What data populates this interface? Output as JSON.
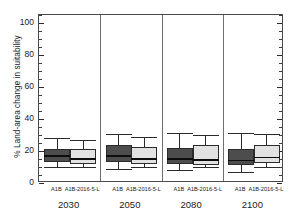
{
  "chart_data": {
    "type": "box",
    "title": "",
    "xlabel": "",
    "ylabel": "% Land-area change in suitability",
    "ylim": [
      0,
      105
    ],
    "yticks": [
      0,
      20,
      40,
      60,
      80,
      100
    ],
    "ytick_labels": [
      "0",
      "20",
      "40",
      "60",
      "80",
      "100"
    ],
    "yminor_step": 5,
    "grid": false,
    "legend": "none",
    "groups": [
      "2030",
      "2050",
      "2080",
      "2100"
    ],
    "categories": [
      "A1B",
      "A1B-2016-5-L"
    ],
    "colors": {
      "A1B": "#4d4d4d",
      "A1B-2016-5-L": "#e2e2e2",
      "outline": "#2b2b2b",
      "median": "#0d0d0d",
      "frame": "#4a4a4a",
      "separator": "#6e6e6e",
      "background": "#ffffff"
    },
    "boxes": [
      {
        "group": "2030",
        "category": "A1B",
        "whisker_low": 10.0,
        "q1": 13.0,
        "median": 17.0,
        "q3": 21.0,
        "whisker_high": 28.0
      },
      {
        "group": "2030",
        "category": "A1B-2016-5-L",
        "whisker_low": 10.0,
        "q1": 12.0,
        "median": 15.0,
        "q3": 21.0,
        "whisker_high": 27.0
      },
      {
        "group": "2050",
        "category": "A1B",
        "whisker_low": 9.0,
        "q1": 13.0,
        "median": 17.0,
        "q3": 24.0,
        "whisker_high": 30.5
      },
      {
        "group": "2050",
        "category": "A1B-2016-5-L",
        "whisker_low": 10.0,
        "q1": 12.0,
        "median": 15.0,
        "q3": 22.5,
        "whisker_high": 29.0
      },
      {
        "group": "2080",
        "category": "A1B",
        "whisker_low": 8.0,
        "q1": 12.0,
        "median": 15.0,
        "q3": 22.0,
        "whisker_high": 31.5
      },
      {
        "group": "2080",
        "category": "A1B-2016-5-L",
        "whisker_low": 10.0,
        "q1": 11.5,
        "median": 14.5,
        "q3": 23.5,
        "whisker_high": 30.0
      },
      {
        "group": "2100",
        "category": "A1B",
        "whisker_low": 7.0,
        "q1": 11.0,
        "median": 14.0,
        "q3": 21.5,
        "whisker_high": 31.0
      },
      {
        "group": "2100",
        "category": "A1B-2016-5-L",
        "whisker_low": 10.0,
        "q1": 12.5,
        "median": 16.0,
        "q3": 24.0,
        "whisker_high": 30.5
      }
    ]
  }
}
